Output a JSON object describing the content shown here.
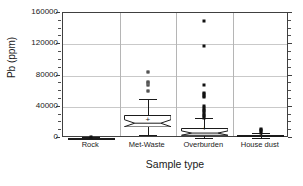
{
  "chart_data": {
    "type": "box",
    "title": "",
    "xlabel": "Sample type",
    "ylabel": "Pb (ppm)",
    "categories": [
      "Rock",
      "Met-Waste",
      "Overburden",
      "House dust"
    ],
    "ylim": [
      0,
      160000
    ],
    "ytick_labels": [
      "0",
      "40000",
      "80000",
      "120000",
      "160000"
    ],
    "ytick_values": [
      0,
      40000,
      80000,
      120000,
      160000
    ],
    "yminor_step": 10000,
    "grid": "horizontal",
    "legend": "none",
    "notched": true,
    "mean_marker": "+",
    "series": [
      {
        "name": "Rock",
        "min": 0,
        "q1": 150,
        "median": 300,
        "q3": 600,
        "max": 1200,
        "mean": 400,
        "whisker_low": 0,
        "whisker_high": 1200,
        "outliers": [
          900
        ]
      },
      {
        "name": "Met-Waste",
        "min": 4000,
        "q1": 13500,
        "median": 19000,
        "q3": 29500,
        "max": 50000,
        "mean": 22500,
        "whisker_low": 4000,
        "whisker_high": 50000,
        "outliers": [
          60000,
          68000,
          70000,
          72000,
          85000
        ]
      },
      {
        "name": "Overburden",
        "min": 200,
        "q1": 3000,
        "median": 6500,
        "q3": 13000,
        "max": 25000,
        "mean": 11000,
        "whisker_low": 200,
        "whisker_high": 25000,
        "outliers": [
          26000,
          28000,
          30000,
          32000,
          34000,
          36000,
          38000,
          41000,
          52000,
          54000,
          56000,
          58000,
          68000,
          118000,
          150000
        ]
      },
      {
        "name": "House dust",
        "min": 300,
        "q1": 1500,
        "median": 2800,
        "q3": 4200,
        "max": 6000,
        "mean": 3200,
        "whisker_low": 300,
        "whisker_high": 6000,
        "outliers": [
          7000,
          8500,
          10000,
          11500
        ]
      }
    ]
  },
  "axis": {
    "y_title": "Pb (ppm)",
    "x_title": "Sample type"
  }
}
